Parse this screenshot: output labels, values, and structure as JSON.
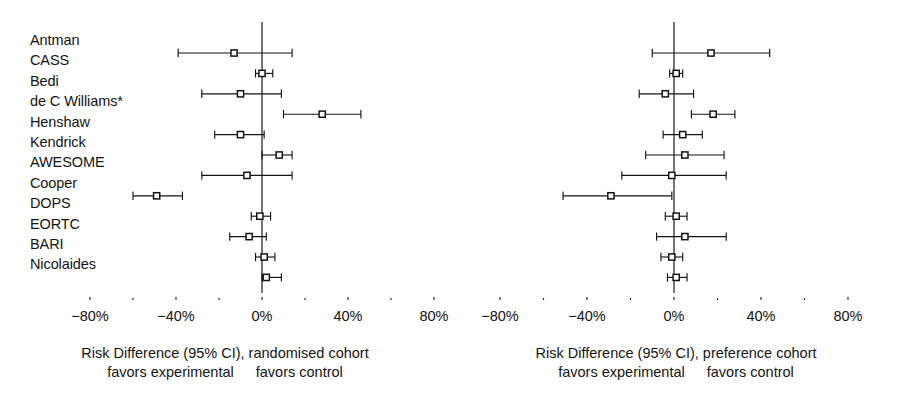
{
  "figure": {
    "type": "forest-plot-pair",
    "studies": [
      "Antman",
      "CASS",
      "Bedi",
      "de C Williams*",
      "Henshaw",
      "Kendrick",
      "AWESOME",
      "Cooper",
      "DOPS",
      "EORTC",
      "BARI",
      "Nicolaides"
    ],
    "axis": {
      "min": -80,
      "max": 80,
      "major_ticks": [
        -80,
        -40,
        0,
        40,
        80
      ],
      "major_tick_labels": [
        "−80%",
        "−40%",
        "0%",
        "40%",
        "80%"
      ],
      "minor_ticks": [
        -60,
        -20,
        20,
        60
      ],
      "unit": "%"
    },
    "colors": {
      "ink": "#141414",
      "rule": "#2a2a2a",
      "background": "#ffffff"
    }
  },
  "chart_data": [
    {
      "type": "forest",
      "panel": "left",
      "title": "",
      "xlabel": "Risk Difference (95% CI), randomised cohort",
      "caption_line1": "Risk Difference (95% CI), randomised cohort",
      "caption_left": "favors experimental",
      "caption_right": "favors control",
      "ylabel": "",
      "xlim": [
        -80,
        80
      ],
      "grid": false,
      "reference_line": 0,
      "categories": [
        "Antman",
        "CASS",
        "Bedi",
        "de C Williams*",
        "Henshaw",
        "Kendrick",
        "AWESOME",
        "Cooper",
        "DOPS",
        "EORTC",
        "BARI",
        "Nicolaides"
      ],
      "values": [
        -13,
        0,
        -10,
        28,
        -10,
        8,
        -7,
        -49,
        -1,
        -6,
        1,
        2
      ],
      "ci_low": [
        -39,
        -3,
        -28,
        10,
        -22,
        0,
        -28,
        -60,
        -5,
        -15,
        -3,
        0
      ],
      "ci_high": [
        14,
        5,
        9,
        46,
        1,
        14,
        14,
        -37,
        4,
        2,
        6,
        9
      ]
    },
    {
      "type": "forest",
      "panel": "right",
      "title": "",
      "xlabel": "Risk Difference (95% CI), preference cohort",
      "caption_line1": "Risk Difference (95% CI), preference cohort",
      "caption_left": "favors experimental",
      "caption_right": "favors control",
      "ylabel": "",
      "xlim": [
        -80,
        80
      ],
      "grid": false,
      "reference_line": 0,
      "categories": [
        "Antman",
        "CASS",
        "Bedi",
        "de C Williams*",
        "Henshaw",
        "Kendrick",
        "AWESOME",
        "Cooper",
        "DOPS",
        "EORTC",
        "BARI",
        "Nicolaides"
      ],
      "values": [
        17,
        1,
        -4,
        18,
        4,
        5,
        -1,
        -29,
        1,
        5,
        -1,
        1
      ],
      "ci_low": [
        -10,
        -2,
        -16,
        8,
        -5,
        -13,
        -24,
        -51,
        -4,
        -8,
        -6,
        -3
      ],
      "ci_high": [
        44,
        4,
        9,
        28,
        13,
        23,
        24,
        -1,
        6,
        24,
        4,
        6
      ]
    }
  ],
  "panels": {
    "left": {
      "caption_main": "Risk Difference (95% CI), randomised cohort",
      "caption_favors_experimental": "favors experimental",
      "caption_favors_control": "favors control",
      "tick_labels": [
        "−80%",
        "−40%",
        "0%",
        "40%",
        "80%"
      ]
    },
    "right": {
      "caption_main": "Risk Difference (95% CI), preference cohort",
      "caption_favors_experimental": "favors experimental",
      "caption_favors_control": "favors control",
      "tick_labels": [
        "−80%",
        "−40%",
        "0%",
        "40%",
        "80%"
      ]
    }
  }
}
